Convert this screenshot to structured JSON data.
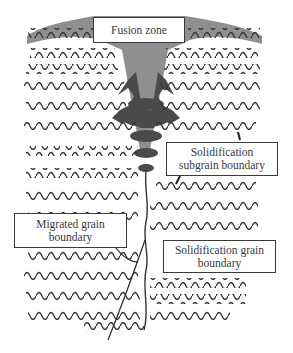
{
  "labels": {
    "fusion_zone": "Fusion zone",
    "subgrain_boundary": {
      "line1": "Solidification",
      "line2": "subgrain boundary"
    },
    "migrated_boundary": {
      "line1": "Migrated grain",
      "line2": "boundary"
    },
    "grain_boundary": {
      "line1": "Solidification grain",
      "line2": "boundary"
    }
  },
  "colors": {
    "wave_line": "#333333",
    "fusion_zone_light": "#8f8f8f",
    "fusion_zone_dark": "#4a4a4a",
    "box_border": "#3a3a3a"
  }
}
